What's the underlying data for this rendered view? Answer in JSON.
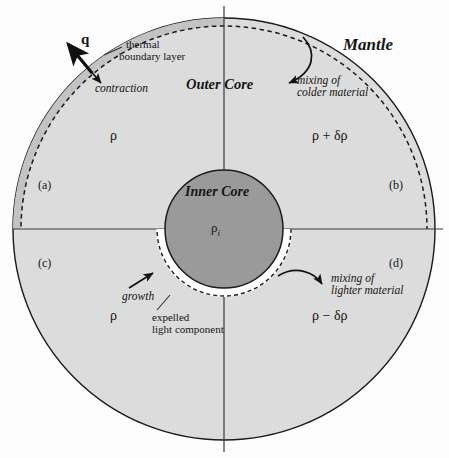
{
  "figure": {
    "title_regions": {
      "mantle": "Mantle",
      "outer_core": "Outer Core",
      "inner_core": "Inner Core"
    },
    "quadrant_labels": {
      "a": "(a)",
      "b": "(b)",
      "c": "(c)",
      "d": "(d)"
    },
    "density_labels": {
      "upper_left": "ρ",
      "upper_right": "ρ + δρ",
      "lower_left": "ρ",
      "lower_right": "ρ − δρ",
      "inner_core_center": "ρ",
      "inner_core_center_sub": "i"
    },
    "annotations": {
      "heat_flux": "q",
      "thermal_boundary_layer_line1": "thermal",
      "thermal_boundary_layer_line2": "boundary layer",
      "contraction": "contraction",
      "mixing_colder_line1": "mixing of",
      "mixing_colder_line2": "colder material",
      "growth": "growth",
      "expelled_line1": "expelled",
      "expelled_line2": "light component",
      "mixing_lighter_line1": "mixing of",
      "mixing_lighter_line2": "lighter material"
    },
    "colors": {
      "background": "#fdfdfd",
      "outer_core_fill": "#dcdcdc",
      "thermal_boundary_fill": "#c6c6c6",
      "inner_core_fill": "#9a9a9a",
      "expelled_layer_fill": "#ffffff",
      "stroke": "#1a1a1a",
      "axis": "#333333",
      "text": "#151515"
    },
    "geometry": {
      "center_x": 224,
      "center_y": 229,
      "outer_radius": 211,
      "dashed_radius": 203,
      "inner_radius": 60,
      "inner_dashed_radius": 66
    }
  }
}
